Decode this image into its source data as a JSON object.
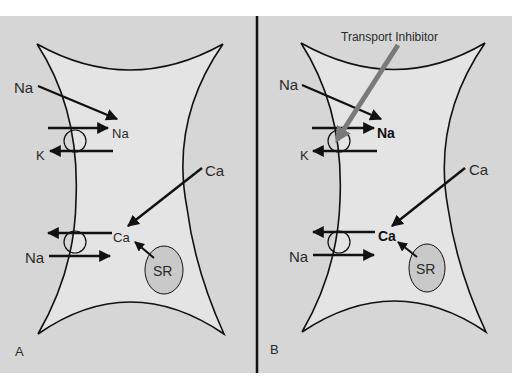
{
  "figure": {
    "colors": {
      "background": "#d6d6d6",
      "cell_fill": "#e4e4e4",
      "sr_fill": "#c9c9c9",
      "stroke": "#111111",
      "inhibitor_arrow": "#7a7a7a",
      "divider": "#111111"
    },
    "panels": [
      {
        "id": "A",
        "panel_label": "A",
        "labels": {
          "na_outside_top": "Na",
          "na_inside_top": "Na",
          "k_outside": "K",
          "ca_outside": "Ca",
          "ca_inside": "Ca",
          "na_outside_bottom": "Na",
          "sr": "SR"
        }
      },
      {
        "id": "B",
        "panel_label": "B",
        "inhibitor_label": "Transport Inhibitor",
        "labels": {
          "na_outside_top": "Na",
          "na_inside_top": "Na",
          "k_outside": "K",
          "ca_outside": "Ca",
          "ca_inside": "Ca",
          "na_outside_bottom": "Na",
          "sr": "SR"
        }
      }
    ]
  }
}
